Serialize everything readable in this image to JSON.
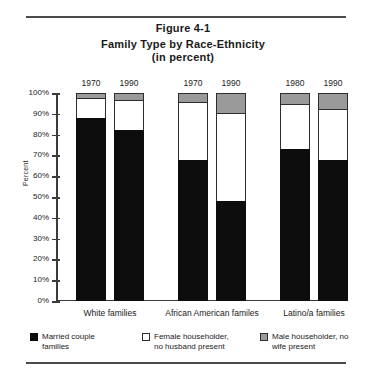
{
  "figure": {
    "number": "Figure 4-1",
    "title": "Family Type by Race-Ethnicity",
    "subtitle": "(in percent)"
  },
  "chart_data": {
    "type": "bar",
    "stacked": true,
    "title": "Family Type by Race-Ethnicity (in percent)",
    "xlabel": "",
    "ylabel": "Percent",
    "ylim": [
      0,
      100
    ],
    "grid": false,
    "legend_position": "bottom",
    "ticklabels": [
      "100%",
      "90%",
      "80%",
      "70%",
      "60%",
      "50%",
      "40%",
      "30%",
      "20%",
      "10%",
      "0%"
    ],
    "tickvalues": [
      100,
      90,
      80,
      70,
      60,
      50,
      40,
      30,
      20,
      10,
      0
    ],
    "groups": [
      {
        "label": "White families",
        "bars": [
          {
            "year": "1970",
            "married_couple": 88,
            "female_householder": 9,
            "male_householder": 3
          },
          {
            "year": "1990",
            "married_couple": 82,
            "female_householder": 14,
            "male_householder": 4
          }
        ]
      },
      {
        "label": "African American familes",
        "bars": [
          {
            "year": "1970",
            "married_couple": 68,
            "female_householder": 27,
            "male_householder": 5
          },
          {
            "year": "1990",
            "married_couple": 48,
            "female_householder": 42,
            "male_householder": 10
          }
        ]
      },
      {
        "label": "Latino/a families",
        "bars": [
          {
            "year": "1980",
            "married_couple": 73,
            "female_householder": 21,
            "male_householder": 6
          },
          {
            "year": "1990",
            "married_couple": 68,
            "female_householder": 24,
            "male_householder": 8
          }
        ]
      }
    ],
    "series": [
      {
        "name": "Married couple families",
        "key": "married_couple",
        "color": "#0d0d0d",
        "values": [
          88,
          82,
          68,
          48,
          73,
          68
        ]
      },
      {
        "name": "Female householder, no husband present",
        "key": "female_householder",
        "color": "#ffffff",
        "values": [
          9,
          14,
          27,
          42,
          21,
          24
        ]
      },
      {
        "name": "Male householder, no wife present",
        "key": "male_householder",
        "color": "#9a9a9a",
        "values": [
          3,
          4,
          5,
          10,
          6,
          8
        ]
      }
    ],
    "categories": [
      "White 1970",
      "White 1990",
      "African American 1970",
      "African American 1990",
      "Latino/a 1980",
      "Latino/a 1990"
    ]
  },
  "legend": {
    "items": [
      {
        "swatch": "black",
        "text": "Married couple\nfamilies"
      },
      {
        "swatch": "white",
        "text": "Female householder,\nno husband present"
      },
      {
        "swatch": "gray",
        "text": "Male householder, no\nwife present"
      }
    ]
  }
}
